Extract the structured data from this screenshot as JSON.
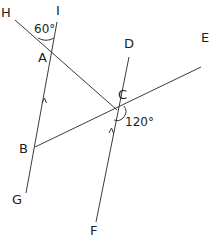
{
  "diagram": {
    "type": "geometry-parallel-lines",
    "points": {
      "H": "H",
      "I": "I",
      "A": "A",
      "B": "B",
      "C": "C",
      "D": "D",
      "E": "E",
      "F": "F",
      "G": "G"
    },
    "angles": {
      "angle_HAI": "60°",
      "angle_DCE_lower": "120°"
    },
    "lines": [
      {
        "name": "HC",
        "from": "H",
        "to": "C"
      },
      {
        "name": "IG",
        "from": "I",
        "to": "G",
        "through": [
          "A",
          "B"
        ]
      },
      {
        "name": "DF",
        "from": "D",
        "to": "F",
        "through": [
          "C"
        ]
      },
      {
        "name": "BE",
        "from": "B",
        "to": "E",
        "through": [
          "C"
        ]
      }
    ],
    "parallel_marks": [
      "IG",
      "DF"
    ],
    "colors": {
      "line": "#3b3b3b",
      "text": "#231f20",
      "background": "#ffffff"
    }
  }
}
